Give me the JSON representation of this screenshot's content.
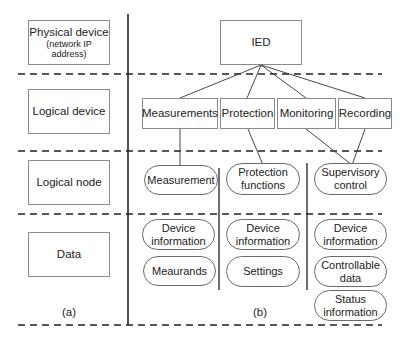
{
  "layers": {
    "physical_device": {
      "title": "Physical device",
      "subtitle": "(network IP address)"
    },
    "logical_device": {
      "title": "Logical device"
    },
    "logical_node": {
      "title": "Logical node"
    },
    "data": {
      "title": "Data"
    }
  },
  "panel_labels": {
    "a": "(a)",
    "b": "(b)"
  },
  "ied": {
    "label": "IED"
  },
  "logical_devices": [
    {
      "label": "Measurements"
    },
    {
      "label": "Protection"
    },
    {
      "label": "Monitoring"
    },
    {
      "label": "Recording"
    }
  ],
  "logical_nodes": [
    {
      "label": "Measurement"
    },
    {
      "label_line1": "Protection",
      "label_line2": "functions"
    },
    {
      "label_line1": "Supervisory",
      "label_line2": "control"
    }
  ],
  "data_columns": [
    {
      "items": [
        {
          "line1": "Device",
          "line2": "information"
        },
        {
          "line1": "Meaurands"
        }
      ]
    },
    {
      "items": [
        {
          "line1": "Device",
          "line2": "information"
        },
        {
          "line1": "Settings"
        }
      ]
    },
    {
      "items": [
        {
          "line1": "Device",
          "line2": "information"
        },
        {
          "line1": "Controllable",
          "line2": "data"
        },
        {
          "line1": "Status",
          "line2": "information"
        }
      ]
    }
  ]
}
